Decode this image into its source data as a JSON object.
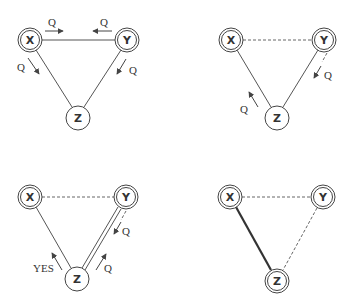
{
  "diagram": {
    "panels": [
      {
        "id": "top-left",
        "nodes": [
          {
            "label": "X",
            "x": 30,
            "y": 40,
            "double_ring": true
          },
          {
            "label": "Y",
            "x": 127,
            "y": 40,
            "double_ring": true
          },
          {
            "label": "Z",
            "x": 78,
            "y": 118,
            "double_ring": false
          }
        ],
        "edges": [
          {
            "from": "X",
            "to": "Y",
            "style": "solid"
          },
          {
            "from": "X",
            "to": "Z",
            "style": "solid"
          },
          {
            "from": "Y",
            "to": "Z",
            "style": "solid"
          }
        ],
        "messages": [
          {
            "label": "Q",
            "direction": "X→Y"
          },
          {
            "label": "Q",
            "direction": "Y→X"
          },
          {
            "label": "Q",
            "direction": "X→Z"
          },
          {
            "label": "Q",
            "direction": "Y→Z"
          }
        ]
      },
      {
        "id": "top-right",
        "nodes": [
          {
            "label": "X",
            "x": 231,
            "y": 40,
            "double_ring": true
          },
          {
            "label": "Y",
            "x": 324,
            "y": 40,
            "double_ring": true
          },
          {
            "label": "Z",
            "x": 277,
            "y": 118,
            "double_ring": false
          }
        ],
        "edges": [
          {
            "from": "X",
            "to": "Y",
            "style": "dashed"
          },
          {
            "from": "X",
            "to": "Z",
            "style": "solid"
          },
          {
            "from": "Y",
            "to": "Z",
            "style": "solid+dashed"
          }
        ],
        "messages": [
          {
            "label": "Q",
            "direction": "Y→Z"
          },
          {
            "label": "Q",
            "direction": "Z→X"
          }
        ]
      },
      {
        "id": "bottom-left",
        "nodes": [
          {
            "label": "X",
            "x": 30,
            "y": 197,
            "double_ring": true
          },
          {
            "label": "Y",
            "x": 126,
            "y": 197,
            "double_ring": true
          },
          {
            "label": "Z",
            "x": 77,
            "y": 279,
            "double_ring": false
          }
        ],
        "edges": [
          {
            "from": "X",
            "to": "Y",
            "style": "dashed"
          },
          {
            "from": "X",
            "to": "Z",
            "style": "solid"
          },
          {
            "from": "Y",
            "to": "Z",
            "style": "double+dashed"
          }
        ],
        "messages": [
          {
            "label": "YES",
            "direction": "Z→X"
          },
          {
            "label": "Q",
            "direction": "Y→Z"
          },
          {
            "label": "Q",
            "direction": "Z→Y"
          }
        ]
      },
      {
        "id": "bottom-right",
        "nodes": [
          {
            "label": "X",
            "x": 230,
            "y": 197,
            "double_ring": true
          },
          {
            "label": "Y",
            "x": 323,
            "y": 197,
            "double_ring": true
          },
          {
            "label": "Z",
            "x": 277,
            "y": 281,
            "double_ring": true
          }
        ],
        "edges": [
          {
            "from": "X",
            "to": "Y",
            "style": "dashed"
          },
          {
            "from": "X",
            "to": "Z",
            "style": "bold"
          },
          {
            "from": "Y",
            "to": "Z",
            "style": "dashed"
          }
        ],
        "messages": []
      }
    ]
  },
  "labels": {
    "x": "X",
    "y": "Y",
    "z": "Z",
    "q": "Q",
    "yes": "YES"
  }
}
